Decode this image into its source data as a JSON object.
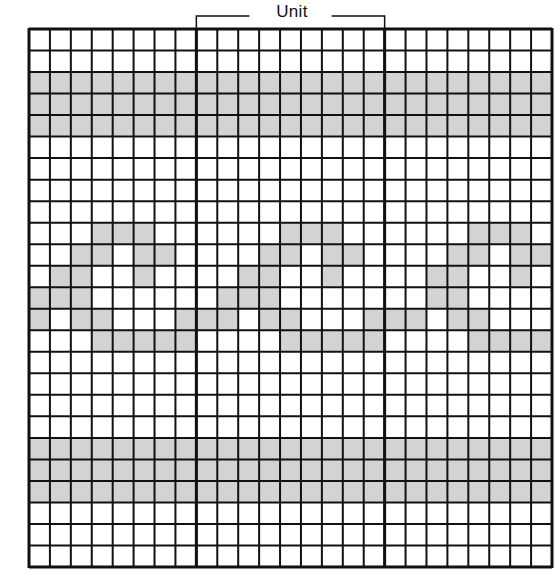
{
  "diagram": {
    "title": "",
    "unit_label": "Unit",
    "grid": {
      "columns": 25,
      "rows": 25,
      "origin_x": 29,
      "origin_y": 29,
      "width": 523,
      "height": 538,
      "shade_color": "#d3d3d3",
      "line_color": "#111111",
      "background_color": "#ffffff"
    },
    "unit_dividers": {
      "columns": [
        0,
        8,
        17,
        25
      ],
      "description": "Heavy vertical lines separating repeat units; the bracketed unit spans columns 8 to 17 (9 columns)"
    },
    "unit_bracket": {
      "start_column": 8,
      "end_column": 17,
      "y": 16
    },
    "shaded_full_rows": [
      2,
      3,
      4,
      19,
      20,
      21
    ],
    "shaded_cells": [
      {
        "row": 9,
        "cols": [
          3,
          4,
          5,
          12,
          13,
          14,
          21,
          22,
          23
        ]
      },
      {
        "row": 10,
        "cols": [
          2,
          3,
          5,
          6,
          11,
          12,
          14,
          15,
          20,
          21,
          23,
          24
        ]
      },
      {
        "row": 11,
        "cols": [
          1,
          2,
          5,
          10,
          11,
          14,
          19,
          20,
          23
        ]
      },
      {
        "row": 12,
        "cols": [
          0,
          1,
          2,
          9,
          10,
          11,
          19,
          20
        ]
      },
      {
        "row": 13,
        "cols": [
          0,
          2,
          3,
          7,
          8,
          9,
          11,
          12,
          16,
          17,
          18,
          20,
          21
        ]
      },
      {
        "row": 14,
        "cols": [
          3,
          4,
          5,
          6,
          7,
          12,
          13,
          14,
          15,
          16,
          21,
          22,
          23,
          24
        ]
      }
    ]
  }
}
